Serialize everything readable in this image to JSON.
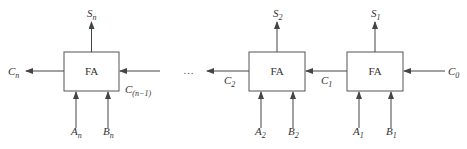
{
  "diagram": {
    "title": "",
    "type": "ripple-carry adder",
    "colors": {
      "line": "#444444",
      "text": "#333333",
      "background": "#ffffff"
    },
    "blocks": [
      {
        "id": "stage-n",
        "label": "FA",
        "sum": {
          "base": "S",
          "sub": "n"
        },
        "a": {
          "base": "A",
          "sub": "n"
        },
        "b": {
          "base": "B",
          "sub": "n"
        },
        "carry_out": {
          "base": "C",
          "sub": "n"
        },
        "carry_in": {
          "base": "C",
          "sub": "(n−1)"
        }
      },
      {
        "id": "stage-2",
        "label": "FA",
        "sum": {
          "base": "S",
          "sub": "2"
        },
        "a": {
          "base": "A",
          "sub": "2"
        },
        "b": {
          "base": "B",
          "sub": "2"
        },
        "carry_out": {
          "base": "C",
          "sub": "2"
        }
      },
      {
        "id": "stage-1",
        "label": "FA",
        "sum": {
          "base": "S",
          "sub": "1"
        },
        "a": {
          "base": "A",
          "sub": "1"
        },
        "b": {
          "base": "B",
          "sub": "1"
        },
        "carry_out": {
          "base": "C",
          "sub": "1"
        },
        "carry_in": {
          "base": "C",
          "sub": "0"
        }
      }
    ],
    "ellipsis": "…"
  }
}
